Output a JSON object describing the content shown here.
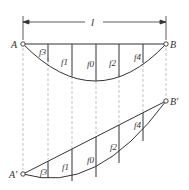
{
  "diagram": {
    "span_label": "l",
    "top": {
      "left_support": "A",
      "right_support": "B",
      "ordinates": [
        "f3",
        "f1",
        "f0",
        "f2",
        "f4"
      ]
    },
    "bottom": {
      "left_support": "A'",
      "right_support": "B'",
      "ordinates": [
        "f3",
        "f1",
        "f0",
        "f2",
        "f4"
      ]
    },
    "colors": {
      "line": "#333333",
      "dashed": "#888888"
    }
  }
}
